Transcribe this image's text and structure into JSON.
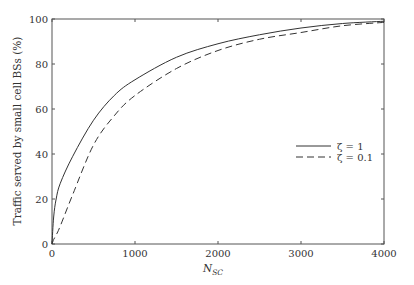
{
  "chart_data": {
    "type": "line",
    "title": "",
    "xlabel": "N",
    "xlabel_subscript": "SC",
    "ylabel": "Traffic served by small cell BSs (%)",
    "xlim": [
      0,
      4000
    ],
    "ylim": [
      0,
      100
    ],
    "xticks": [
      0,
      1000,
      2000,
      3000,
      4000
    ],
    "yticks": [
      0,
      20,
      40,
      60,
      80,
      100
    ],
    "grid": false,
    "legend_position": "center-right",
    "x": [
      0,
      20,
      50,
      100,
      250,
      500,
      750,
      1000,
      1500,
      2000,
      2500,
      3000,
      3500,
      4000
    ],
    "series": [
      {
        "name": "ζ = 1",
        "style": "solid",
        "color": "#333333",
        "values": [
          0,
          12,
          20,
          27,
          39,
          55,
          66,
          73,
          83,
          89,
          93,
          96,
          98,
          99
        ]
      },
      {
        "name": "ζ = 0.1",
        "style": "dashed",
        "color": "#333333",
        "values": [
          0,
          2,
          4,
          8,
          22,
          44,
          57,
          66,
          78,
          86,
          91,
          94,
          97,
          98.5
        ]
      }
    ]
  },
  "labels": {
    "ylabel": "Traffic served by small cell BSs (%)",
    "xlabel_main": "N",
    "xlabel_sub": "SC",
    "legend_1": "ζ = 1",
    "legend_2": "ζ = 0.1"
  }
}
